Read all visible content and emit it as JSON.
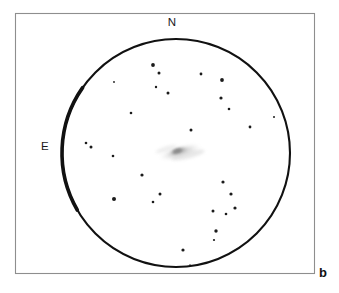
{
  "figure": {
    "panel_letter": "b",
    "caption_type": "astronomical eyepiece sketch",
    "background_color": "#ffffff",
    "frame_color": "#8e8e8e",
    "ink_color": "#111111"
  },
  "orientation": {
    "north_label": "N",
    "east_label": "E",
    "north_position": {
      "x": 172,
      "y": 26
    },
    "east_position": {
      "x": 45,
      "y": 150
    }
  },
  "field_of_view": {
    "label": "eyepiece field of view",
    "center_x": 176,
    "center_y": 153,
    "radius": 114,
    "stroke_width": 2.1,
    "thick_arc_stroke_width": 3.6,
    "thick_arc_start_deg": 150,
    "thick_arc_end_deg": 215
  },
  "frame": {
    "x": 15,
    "y": 13,
    "width": 300,
    "height": 261
  },
  "chart_data": {
    "type": "scatter",
    "title": "",
    "xlabel": "",
    "ylabel": "",
    "legend": [],
    "grid": false,
    "nebula": {
      "name": "galaxy",
      "center_x": 180,
      "center_y": 152,
      "major_axis": 46,
      "minor_axis": 13,
      "angle_deg": -16,
      "core_major_axis": 20,
      "core_minor_axis": 8,
      "tone": "#b9b9b9",
      "core_tone": "#8c8c8c"
    },
    "stars": [
      {
        "x": 153,
        "y": 65,
        "r": 1.9
      },
      {
        "x": 159,
        "y": 73,
        "r": 1.5
      },
      {
        "x": 114,
        "y": 82,
        "r": 0.9
      },
      {
        "x": 201,
        "y": 74,
        "r": 1.4
      },
      {
        "x": 222,
        "y": 80,
        "r": 1.9
      },
      {
        "x": 156,
        "y": 87,
        "r": 1.2
      },
      {
        "x": 168,
        "y": 93,
        "r": 1.5
      },
      {
        "x": 221,
        "y": 98,
        "r": 1.6
      },
      {
        "x": 131,
        "y": 113,
        "r": 1.3
      },
      {
        "x": 229,
        "y": 109,
        "r": 1.3
      },
      {
        "x": 274,
        "y": 117,
        "r": 1.0
      },
      {
        "x": 191,
        "y": 130,
        "r": 1.5
      },
      {
        "x": 250,
        "y": 127,
        "r": 1.4
      },
      {
        "x": 86,
        "y": 143,
        "r": 1.3
      },
      {
        "x": 91,
        "y": 147,
        "r": 1.5
      },
      {
        "x": 113,
        "y": 156,
        "r": 1.3
      },
      {
        "x": 142,
        "y": 175,
        "r": 1.6
      },
      {
        "x": 223,
        "y": 182,
        "r": 1.6
      },
      {
        "x": 160,
        "y": 194,
        "r": 1.5
      },
      {
        "x": 114,
        "y": 199,
        "r": 2.0
      },
      {
        "x": 153,
        "y": 202,
        "r": 1.3
      },
      {
        "x": 231,
        "y": 194,
        "r": 1.6
      },
      {
        "x": 235,
        "y": 208,
        "r": 1.6
      },
      {
        "x": 213,
        "y": 211,
        "r": 1.5
      },
      {
        "x": 226,
        "y": 214,
        "r": 1.3
      },
      {
        "x": 216,
        "y": 231,
        "r": 1.7
      },
      {
        "x": 214,
        "y": 240,
        "r": 1.1
      },
      {
        "x": 183,
        "y": 250,
        "r": 1.6
      },
      {
        "x": 190,
        "y": 265,
        "r": 0.8
      }
    ],
    "star_count": 29
  }
}
